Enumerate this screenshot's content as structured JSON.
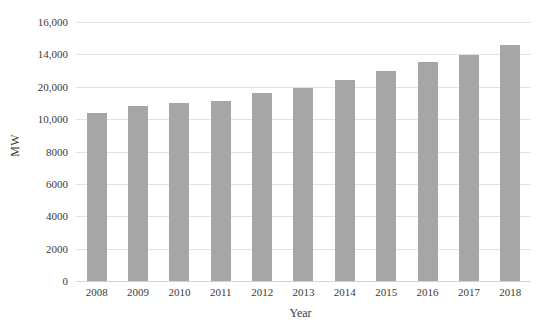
{
  "chart_data": {
    "type": "bar",
    "title": "",
    "subtitle": "",
    "xlabel": "Year",
    "ylabel": "MW",
    "categories": [
      "2008",
      "2009",
      "2010",
      "2011",
      "2012",
      "2013",
      "2014",
      "2015",
      "2016",
      "2017",
      "2018"
    ],
    "values": [
      10400,
      10800,
      11000,
      11100,
      11600,
      11900,
      12400,
      13000,
      13500,
      13950,
      14550
    ],
    "series": [
      {
        "name": "MW",
        "values": [
          10400,
          10800,
          11000,
          11100,
          11600,
          11900,
          12400,
          13000,
          13500,
          13950,
          14550
        ]
      }
    ],
    "ylim": [
      0,
      16000
    ],
    "yticks": [
      0,
      2000,
      4000,
      6000,
      8000,
      10000,
      12000,
      14000,
      16000
    ],
    "ytick_labels": [
      "0",
      "2000",
      "4000",
      "6000",
      "8000",
      "10,000",
      "20,000",
      "14,000",
      "16,000"
    ],
    "grid": true,
    "grid_axis": "y",
    "legend": false,
    "legend_position": "none",
    "bar_color": "#a6a6a6",
    "gridline_color": "#e3e3e3",
    "text_color": "#3b3b3b",
    "background_color": "#ffffff",
    "annotations": []
  }
}
